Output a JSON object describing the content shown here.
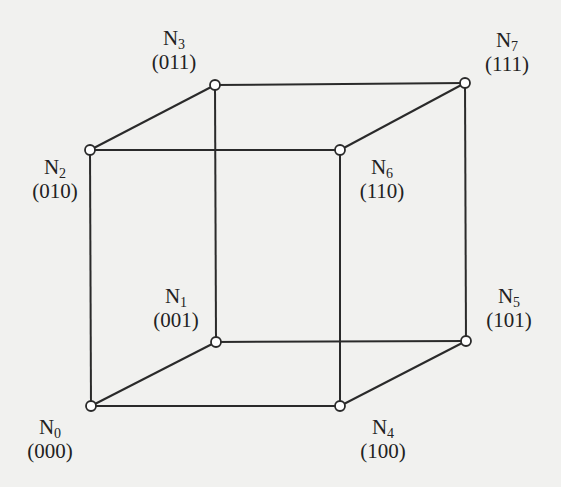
{
  "diagram": {
    "type": "hypercube-3d",
    "background": "#f1f1ef",
    "stroke": "#2a2a2a",
    "nodes": [
      {
        "id": "N0",
        "base": "N",
        "sub": "0",
        "code": "(000)",
        "x": 91,
        "y": 406,
        "label_x": 50,
        "label_y": 417
      },
      {
        "id": "N1",
        "base": "N",
        "sub": "1",
        "code": "(001)",
        "x": 216,
        "y": 342,
        "label_x": 176,
        "label_y": 286
      },
      {
        "id": "N2",
        "base": "N",
        "sub": "2",
        "code": "(010)",
        "x": 90,
        "y": 150,
        "label_x": 55,
        "label_y": 157
      },
      {
        "id": "N3",
        "base": "N",
        "sub": "3",
        "code": "(011)",
        "x": 215,
        "y": 85,
        "label_x": 174,
        "label_y": 28
      },
      {
        "id": "N4",
        "base": "N",
        "sub": "4",
        "code": "(100)",
        "x": 340,
        "y": 406,
        "label_x": 383,
        "label_y": 417
      },
      {
        "id": "N5",
        "base": "N",
        "sub": "5",
        "code": "(101)",
        "x": 466,
        "y": 341,
        "label_x": 509,
        "label_y": 286
      },
      {
        "id": "N6",
        "base": "N",
        "sub": "6",
        "code": "(110)",
        "x": 340,
        "y": 150,
        "label_x": 382,
        "label_y": 157
      },
      {
        "id": "N7",
        "base": "N",
        "sub": "7",
        "code": "(111)",
        "x": 465,
        "y": 83,
        "label_x": 507,
        "label_y": 30
      }
    ],
    "edges": [
      [
        "N0",
        "N1"
      ],
      [
        "N0",
        "N2"
      ],
      [
        "N0",
        "N4"
      ],
      [
        "N1",
        "N3"
      ],
      [
        "N1",
        "N5"
      ],
      [
        "N2",
        "N3"
      ],
      [
        "N2",
        "N6"
      ],
      [
        "N3",
        "N7"
      ],
      [
        "N4",
        "N5"
      ],
      [
        "N4",
        "N6"
      ],
      [
        "N5",
        "N7"
      ],
      [
        "N6",
        "N7"
      ]
    ]
  }
}
